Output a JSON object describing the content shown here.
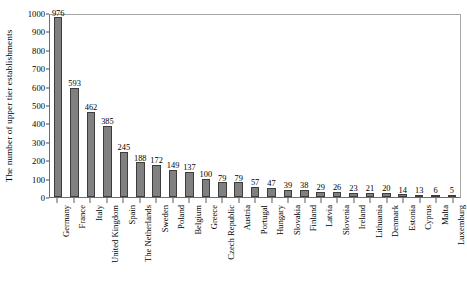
{
  "chart_data": {
    "type": "bar",
    "title": "",
    "subtitle": "",
    "xlabel": "",
    "ylabel": "The number of upper tier establishments",
    "ylim": [
      0,
      1000
    ],
    "ytick_step": 100,
    "ytick_labels": [
      "0",
      "100",
      "200",
      "300",
      "400",
      "500",
      "600",
      "700",
      "800",
      "900",
      "1000"
    ],
    "grid": false,
    "legend": false,
    "legend_position": "none",
    "bar_color": "#808080",
    "bar_edge_color": "#3d3d3d",
    "axis_color": "#6f6f6f",
    "text_color": "#000000",
    "categories": [
      "Germany",
      "France",
      "Italy",
      "United Kingdom",
      "Spain",
      "The Netherlands",
      "Sweden",
      "Poland",
      "Belgium",
      "Greece",
      "Czech Republic",
      "Austria",
      "Portugal",
      "Hungary",
      "Slovakia",
      "Finland",
      "Latvia",
      "Slovenia",
      "Ireland",
      "Lithuania",
      "Denmark",
      "Estonia",
      "Cyprus",
      "Malta",
      "Luxemburg"
    ],
    "values": [
      976,
      593,
      462,
      385,
      245,
      188,
      172,
      149,
      137,
      100,
      79,
      79,
      57,
      47,
      39,
      38,
      29,
      26,
      23,
      21,
      20,
      14,
      13,
      6,
      5
    ],
    "value_labels": [
      "976",
      "593",
      "462",
      "385",
      "245",
      "188",
      "172",
      "149",
      "137",
      "100",
      "79",
      "79",
      "57",
      "47",
      "39",
      "38",
      "29",
      "26",
      "23",
      "21",
      "20",
      "14",
      "13",
      "6",
      "5"
    ]
  }
}
